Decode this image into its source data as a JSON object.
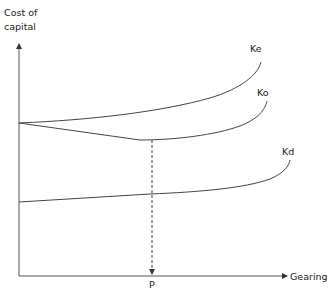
{
  "diagram": {
    "type": "line-diagram",
    "y_axis": {
      "label_line1": "Cost of",
      "label_line2": "capital"
    },
    "x_axis": {
      "label": "Gearing"
    },
    "marker": {
      "label": "P"
    },
    "curves": [
      {
        "name": "Ke",
        "label": "Ke"
      },
      {
        "name": "Ko",
        "label": "Ko"
      },
      {
        "name": "Kd",
        "label": "Kd"
      }
    ]
  },
  "colors": {
    "line": "#333333",
    "text": "#222222"
  }
}
